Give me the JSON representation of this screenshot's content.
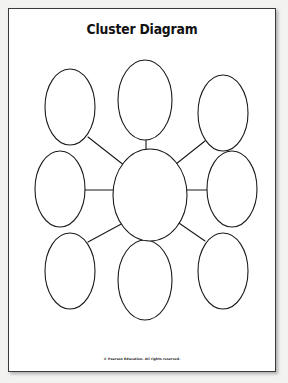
{
  "page": {
    "title": "Cluster Diagram",
    "footer": "© Pearson Education. All rights reserved.",
    "background_color": "#f2f2f1",
    "sheet_color": "#ffffff",
    "ink_color": "#1a1a1a"
  },
  "diagram": {
    "type": "cluster-diagram",
    "stroke_color": "#1a1a1a",
    "stroke_width": 1.1,
    "fill_color": "#ffffff",
    "center": {
      "name": "center-bubble",
      "label": "",
      "cx": 141,
      "cy": 186,
      "rx": 37,
      "ry": 46
    },
    "satellites": [
      {
        "name": "bubble-top-left",
        "label": "",
        "cx": 61,
        "cy": 98,
        "rx": 25,
        "ry": 38,
        "connector": "diagonal"
      },
      {
        "name": "bubble-top-center",
        "label": "",
        "cx": 136,
        "cy": 91,
        "rx": 27,
        "ry": 40,
        "connector": "vertical"
      },
      {
        "name": "bubble-top-right",
        "label": "",
        "cx": 214,
        "cy": 104,
        "rx": 25,
        "ry": 38,
        "connector": "diagonal"
      },
      {
        "name": "bubble-middle-left",
        "label": "",
        "cx": 51,
        "cy": 180,
        "rx": 25,
        "ry": 38,
        "connector": "horizontal"
      },
      {
        "name": "bubble-middle-right",
        "label": "",
        "cx": 223,
        "cy": 180,
        "rx": 25,
        "ry": 38,
        "connector": "horizontal"
      },
      {
        "name": "bubble-bottom-left",
        "label": "",
        "cx": 61,
        "cy": 262,
        "rx": 25,
        "ry": 38,
        "connector": "diagonal"
      },
      {
        "name": "bubble-bottom-center",
        "label": "",
        "cx": 136,
        "cy": 271,
        "rx": 27,
        "ry": 40,
        "connector": "vertical"
      },
      {
        "name": "bubble-bottom-right",
        "label": "",
        "cx": 214,
        "cy": 262,
        "rx": 25,
        "ry": 38,
        "connector": "diagonal"
      }
    ],
    "connectors": [
      {
        "name": "connector-top-left",
        "x1": 79,
        "y1": 128,
        "x2": 116,
        "y2": 157
      },
      {
        "name": "connector-top-center",
        "x1": 137,
        "y1": 131,
        "x2": 137,
        "y2": 141
      },
      {
        "name": "connector-top-right",
        "x1": 196,
        "y1": 132,
        "x2": 167,
        "y2": 155
      },
      {
        "name": "connector-middle-left",
        "x1": 76,
        "y1": 181,
        "x2": 104,
        "y2": 181
      },
      {
        "name": "connector-middle-right",
        "x1": 178,
        "y1": 181,
        "x2": 199,
        "y2": 181
      },
      {
        "name": "connector-bottom-left",
        "x1": 79,
        "y1": 233,
        "x2": 116,
        "y2": 213
      },
      {
        "name": "connector-bottom-center",
        "x1": 137,
        "y1": 232,
        "x2": 137,
        "y2": 240
      },
      {
        "name": "connector-bottom-right",
        "x1": 196,
        "y1": 232,
        "x2": 167,
        "y2": 212
      }
    ]
  }
}
